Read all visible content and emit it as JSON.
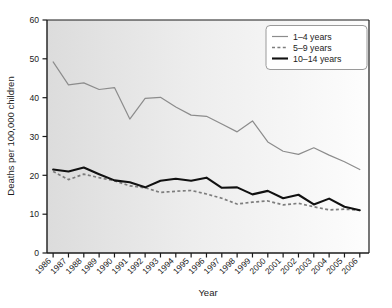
{
  "chart_data": {
    "type": "line",
    "title": "",
    "xlabel": "Year",
    "ylabel": "Deaths per 100,000 children",
    "xlim": [
      1985.6,
      2006.6
    ],
    "ylim": [
      0,
      60
    ],
    "yticks": [
      0,
      10,
      20,
      30,
      40,
      50,
      60
    ],
    "ytick_labels": [
      "0",
      "10",
      "20",
      "30",
      "40",
      "50",
      "60"
    ],
    "grid": false,
    "legend_position": "top-right",
    "x": [
      1986,
      1987,
      1988,
      1989,
      1990,
      1991,
      1992,
      1993,
      1994,
      1995,
      1996,
      1997,
      1998,
      1999,
      2000,
      2001,
      2002,
      2003,
      2004,
      2005,
      2006
    ],
    "categories": [
      "1986",
      "1987",
      "1988",
      "1989",
      "1990",
      "1991",
      "1992",
      "1993",
      "1994",
      "1995",
      "1996",
      "1997",
      "1998",
      "1999",
      "2000",
      "2001",
      "2002",
      "2003",
      "2004",
      "2005",
      "2006"
    ],
    "series": [
      {
        "name": "1–4 years",
        "style": "solid-thin",
        "color": "#8c8c8c",
        "values": [
          49.2,
          43.3,
          43.8,
          42.1,
          42.6,
          34.5,
          39.8,
          40.1,
          37.6,
          35.5,
          35.2,
          33.2,
          31.2,
          34.0,
          28.6,
          26.2,
          25.4,
          27.1,
          25.2,
          23.5,
          21.5
        ]
      },
      {
        "name": "5–9 years",
        "style": "dashed",
        "color": "#7d7d7d",
        "values": [
          21.0,
          18.9,
          20.3,
          19.4,
          18.6,
          17.3,
          16.8,
          15.6,
          15.9,
          16.1,
          15.2,
          14.1,
          12.6,
          13.1,
          13.4,
          12.4,
          12.8,
          11.9,
          11.1,
          11.3,
          11.0
        ]
      },
      {
        "name": "10–14 years",
        "style": "solid-thick",
        "color": "#111111",
        "values": [
          21.5,
          21.0,
          22.0,
          20.3,
          18.7,
          18.2,
          16.9,
          18.6,
          19.1,
          18.6,
          19.4,
          16.8,
          16.9,
          15.1,
          16.0,
          14.1,
          15.0,
          12.5,
          14.0,
          11.9,
          11.0
        ]
      }
    ]
  },
  "legend": {
    "entries": [
      {
        "label": "1–4 years"
      },
      {
        "label": "5–9 years"
      },
      {
        "label": "10–14 years"
      }
    ]
  }
}
